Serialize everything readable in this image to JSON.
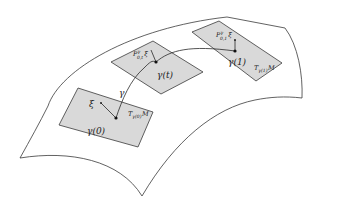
{
  "figure": {
    "colors": {
      "plane_fill": "#d9d9d9",
      "stroke": "#3a3a3a",
      "background": "#ffffff"
    },
    "curve": {
      "label": "γ"
    },
    "planes": [
      {
        "point_label": "γ(0)",
        "vector_label": "ξ",
        "tangent_space_label": "T",
        "tangent_space_sub": "γ(0)",
        "tangent_space_manifold": "M"
      },
      {
        "point_label": "γ(t)",
        "vector_label_P": "P",
        "vector_label_sup": "γ",
        "vector_label_sub": "0,t",
        "vector_label_xi": "ξ"
      },
      {
        "point_label": "γ(1)",
        "vector_label_P": "P",
        "vector_label_sup": "γ",
        "vector_label_sub": "0,1",
        "vector_label_xi": "ξ",
        "tangent_space_label": "T",
        "tangent_space_sub": "γ(1)",
        "tangent_space_manifold": "M"
      }
    ]
  }
}
